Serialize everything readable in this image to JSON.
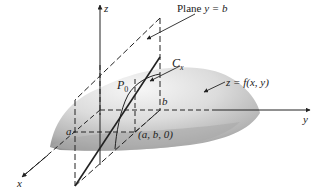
{
  "figure": {
    "labels": {
      "plane": "Plane y = b",
      "plane_prefix": "Plane ",
      "plane_eq": "y = b",
      "curve": "C",
      "curve_sub": "x",
      "surface": "z = f(x, y)",
      "point": "P",
      "point_sub": "0",
      "base_point": "(a, b, 0)",
      "a": "a",
      "b": "b",
      "axis_x": "x",
      "axis_y": "y",
      "axis_z": "z"
    },
    "colors": {
      "line": "#222222",
      "surface_light": "#f2f2f2",
      "surface_dark": "#9a9a9a",
      "background": "#ffffff"
    }
  }
}
